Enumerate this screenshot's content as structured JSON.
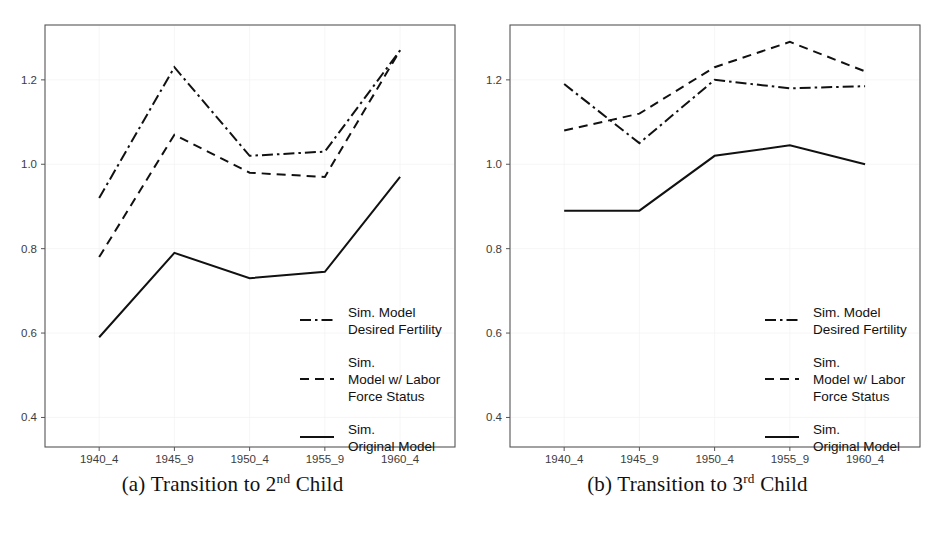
{
  "figure": {
    "y_ticks": [
      "0.4",
      "0.6",
      "0.8",
      "1.0",
      "1.2"
    ],
    "x_ticks": [
      "1940_4",
      "1945_9",
      "1950_4",
      "1955_9",
      "1960_4"
    ],
    "line_color": "#111111",
    "frame_color": "#555555",
    "background": "#ffffff"
  },
  "legend": {
    "items": [
      {
        "style": "dash-dot",
        "line1": "Sim. Model",
        "line2": "Desired Fertility",
        "line3": ""
      },
      {
        "style": "dashed",
        "line1": "Sim.",
        "line2": "Model w/ Labor",
        "line3": "Force Status"
      },
      {
        "style": "solid",
        "line1": "Sim.",
        "line2": "Original Model",
        "line3": ""
      }
    ]
  },
  "panels": [
    {
      "id": "a",
      "caption_prefix": "(a) Transition to ",
      "caption_number": "3",
      "caption_suffix": ""
    }
  ],
  "captions": {
    "a": {
      "label": "(a)",
      "text_before": "Transition to 2",
      "ordinal": "nd",
      "text_after": "Child"
    },
    "b": {
      "label": "(b)",
      "text_before": "Transition to 3",
      "ordinal": "rd",
      "text_after": "Child"
    }
  },
  "chart_data": [
    {
      "panel": "a",
      "type": "line",
      "title": "(a) Transition to 2nd Child",
      "xlabel": "",
      "ylabel": "",
      "categories": [
        "1940_4",
        "1945_9",
        "1950_4",
        "1955_9",
        "1960_4"
      ],
      "ylim": [
        0.33,
        1.33
      ],
      "yticks": [
        0.4,
        0.6,
        0.8,
        1.0,
        1.2
      ],
      "grid": true,
      "legend_position": "lower-right",
      "series": [
        {
          "name": "Sim. Model Desired Fertility",
          "style": "dash-dot",
          "values": [
            0.92,
            1.23,
            1.02,
            1.03,
            1.27
          ]
        },
        {
          "name": "Sim. Model w/ Labor Force Status",
          "style": "dashed",
          "values": [
            0.78,
            1.07,
            0.98,
            0.97,
            1.27
          ]
        },
        {
          "name": "Sim. Original Model",
          "style": "solid",
          "values": [
            0.59,
            0.79,
            0.73,
            0.745,
            0.97
          ]
        }
      ]
    },
    {
      "panel": "b",
      "type": "line",
      "title": "(b) Transition to 3rd Child",
      "xlabel": "",
      "ylabel": "",
      "categories": [
        "1940_4",
        "1945_9",
        "1950_4",
        "1955_9",
        "1960_4"
      ],
      "ylim": [
        0.33,
        1.33
      ],
      "yticks": [
        0.4,
        0.6,
        0.8,
        1.0,
        1.2
      ],
      "grid": true,
      "legend_position": "lower-right",
      "series": [
        {
          "name": "Sim. Model Desired Fertility",
          "style": "dash-dot",
          "values": [
            1.19,
            1.05,
            1.2,
            1.18,
            1.185
          ]
        },
        {
          "name": "Sim. Model w/ Labor Force Status",
          "style": "dashed",
          "values": [
            1.08,
            1.12,
            1.23,
            1.29,
            1.22
          ]
        },
        {
          "name": "Sim. Original Model",
          "style": "solid",
          "values": [
            0.89,
            0.89,
            1.02,
            1.045,
            1.0
          ]
        }
      ]
    }
  ]
}
